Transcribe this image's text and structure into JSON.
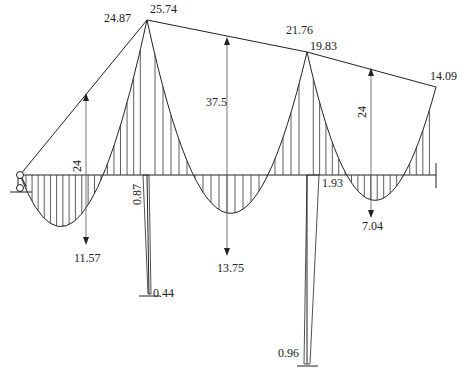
{
  "beam_top_labels": {
    "left_joint_left": "24.87",
    "left_joint_top": "25.74",
    "middle_joint_left": "21.76",
    "middle_joint_right": "19.83",
    "right_end": "14.09"
  },
  "span_labels": {
    "span1_mid_height": "24",
    "span2_mid_height": "37.5",
    "span3_mid_height": "24"
  },
  "sagging_labels": {
    "span1": "11.57",
    "span2": "13.75",
    "span3": "7.04"
  },
  "column_labels": {
    "col1_top": "0.87",
    "col1_bottom": "0.44",
    "col2_top": "1.93",
    "col2_bottom": "0.96"
  },
  "chart_data": {
    "type": "diagram",
    "beam_joint_moments": [
      24.87,
      25.74,
      21.76,
      19.83,
      14.09
    ],
    "span_simple_moments": [
      24,
      37.5,
      24
    ],
    "span_max_sagging": [
      11.57,
      13.75,
      7.04
    ],
    "column_moments": {
      "col1": [
        0.87,
        0.44
      ],
      "col2": [
        1.93,
        0.96
      ]
    }
  }
}
